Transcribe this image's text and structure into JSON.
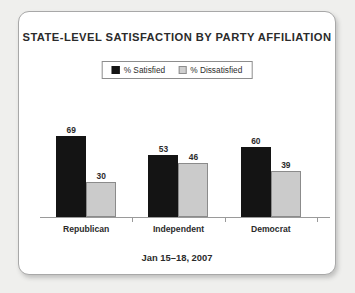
{
  "card": {
    "background": "#ffffff",
    "border_color": "#a8a8a8"
  },
  "chart_data": {
    "type": "bar",
    "title": "STATE-LEVEL SATISFACTION BY PARTY AFFILIATION",
    "subtitle": "",
    "footnote": "Jan 15–18, 2007",
    "xlabel": "",
    "ylabel": "",
    "ylim": [
      0,
      100
    ],
    "grid": false,
    "legend_position": "top-center",
    "categories": [
      "Republican",
      "Independent",
      "Democrat"
    ],
    "series": [
      {
        "name": "% Satisfied",
        "color": "#141414",
        "values": [
          69,
          53,
          60
        ]
      },
      {
        "name": "% Dissatisfied",
        "color": "#cbcbcb",
        "values": [
          30,
          46,
          39
        ]
      }
    ],
    "value_labels": {
      "Republican": {
        "satisfied": "69",
        "dissatisfied": "30"
      },
      "Independent": {
        "satisfied": "53",
        "dissatisfied": "46"
      },
      "Democrat": {
        "satisfied": "60",
        "dissatisfied": "39"
      }
    }
  },
  "legend": {
    "items": [
      {
        "label": "% Satisfied",
        "swatch": "dark"
      },
      {
        "label": "% Dissatisfied",
        "swatch": "light"
      }
    ]
  }
}
